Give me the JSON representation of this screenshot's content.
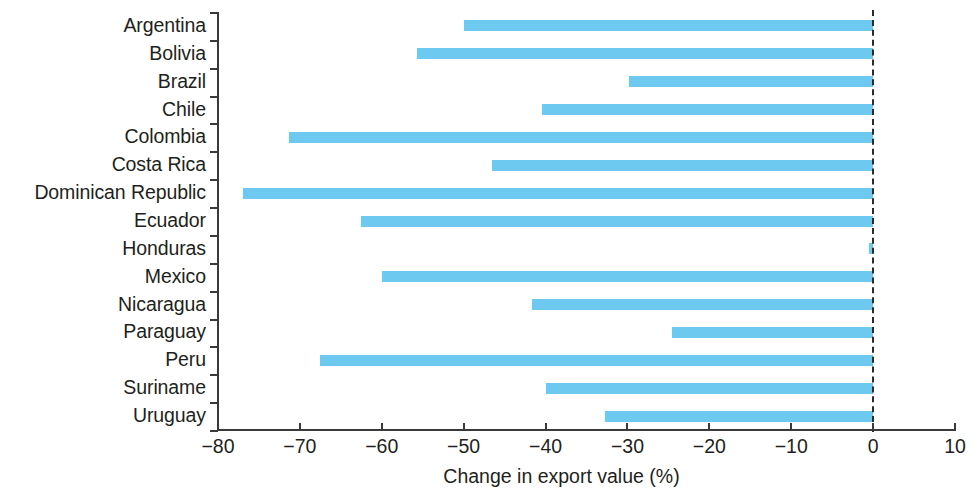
{
  "chart_data": {
    "type": "bar",
    "orientation": "horizontal",
    "title": "",
    "xlabel": "Change in export value (%)",
    "ylabel": "",
    "categories": [
      "Argentina",
      "Bolivia",
      "Brazil",
      "Chile",
      "Colombia",
      "Costa Rica",
      "Dominican Republic",
      "Ecuador",
      "Honduras",
      "Mexico",
      "Nicaragua",
      "Paraguay",
      "Peru",
      "Suriname",
      "Uruguay"
    ],
    "values": [
      -50.0,
      -55.7,
      -29.8,
      -40.4,
      -71.3,
      -46.6,
      -77.0,
      -62.5,
      -0.5,
      -60.0,
      -41.6,
      -24.6,
      -67.5,
      -40.0,
      -32.8
    ],
    "xlim": [
      -80,
      10
    ],
    "xticks": [
      -80,
      -70,
      -60,
      -50,
      -40,
      -30,
      -20,
      -10,
      0,
      10
    ],
    "xtick_labels": [
      "−80",
      "−70",
      "−60",
      "−50",
      "−40",
      "−30",
      "−20",
      "−10",
      "0",
      "10"
    ],
    "grid": false,
    "legend": null,
    "reference_line": {
      "value": 0,
      "style": "dashed",
      "color": "#2b2b2b"
    },
    "bar_color": "#6dc9ef",
    "axis_color": "#3a3a3a",
    "text_color": "#231f20"
  }
}
